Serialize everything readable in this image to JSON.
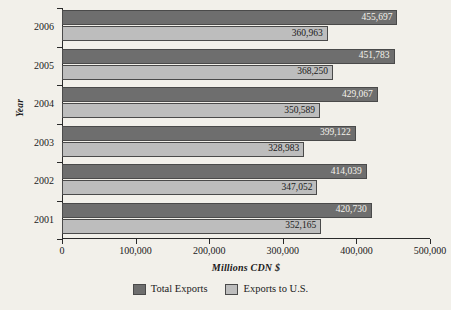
{
  "chart_data": {
    "type": "bar",
    "orientation": "horizontal",
    "title": "",
    "xlabel": "Millions CDN $",
    "ylabel": "Year",
    "categories": [
      "2006",
      "2005",
      "2004",
      "2003",
      "2002",
      "2001"
    ],
    "xlim": [
      0,
      500000
    ],
    "xticks": [
      0,
      100000,
      200000,
      300000,
      400000,
      500000
    ],
    "xtick_labels": [
      "0",
      "100,000",
      "200,000",
      "300,000",
      "400,000",
      "500,000"
    ],
    "grid": false,
    "legend_position": "bottom",
    "series": [
      {
        "name": "Total Exports",
        "color": "#6e6e6e",
        "values": [
          455697,
          451783,
          429067,
          399122,
          414039,
          420730
        ],
        "labels": [
          "455,697",
          "451,783",
          "429,067",
          "399,122",
          "414,039",
          "420,730"
        ]
      },
      {
        "name": "Exports to U.S.",
        "color": "#bdbdbd",
        "values": [
          360963,
          368250,
          350589,
          328983,
          347052,
          352165
        ],
        "labels": [
          "360,963",
          "368,250",
          "350,589",
          "328,983",
          "347,052",
          "352,165"
        ]
      }
    ]
  },
  "legend": {
    "items": [
      {
        "label": "Total Exports",
        "swatch": "total"
      },
      {
        "label": "Exports to U.S.",
        "swatch": "us"
      }
    ]
  }
}
